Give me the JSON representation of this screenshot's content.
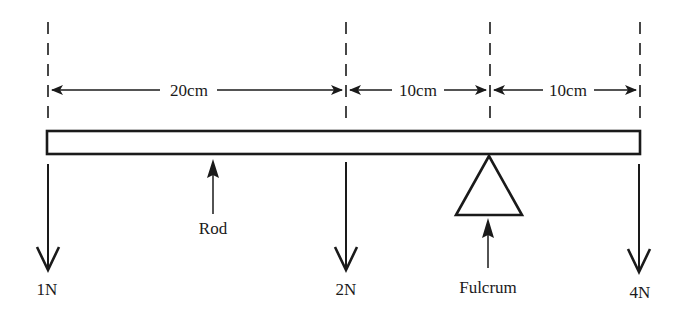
{
  "diagram": {
    "dimensions": [
      {
        "label": "20cm",
        "from_x": 48,
        "to_x": 346
      },
      {
        "label": "10cm",
        "from_x": 346,
        "to_x": 490
      },
      {
        "label": "10cm",
        "from_x": 490,
        "to_x": 640
      }
    ],
    "forces": [
      {
        "label": "1N",
        "x": 48
      },
      {
        "label": "2N",
        "x": 346
      },
      {
        "label": "4N",
        "x": 640
      }
    ],
    "rod_label": "Rod",
    "fulcrum_label": "Fulcrum",
    "colors": {
      "ink": "#1a1a1a",
      "background": "#ffffff"
    }
  }
}
